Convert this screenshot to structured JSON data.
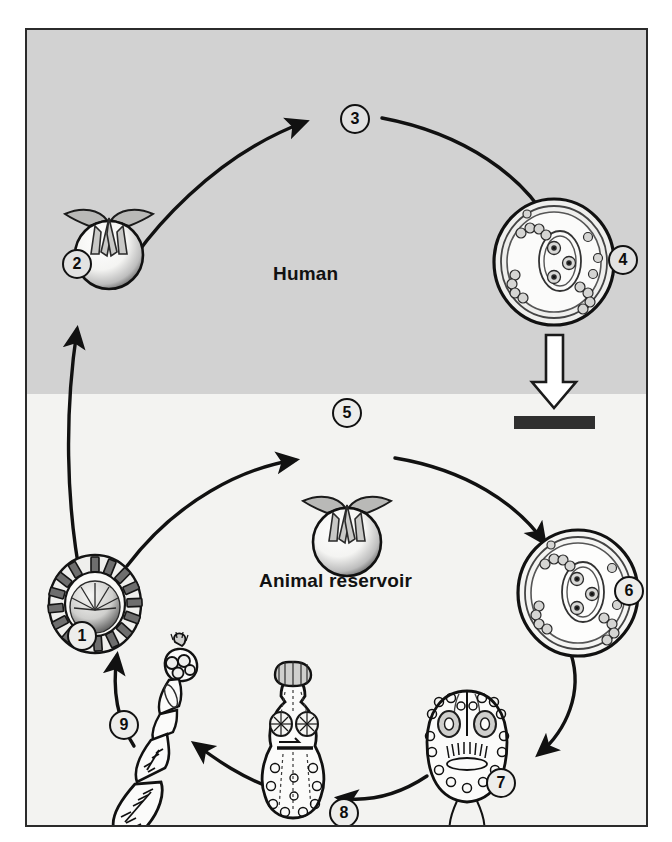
{
  "figure": {
    "type": "parasite-life-cycle-diagram",
    "zones": [
      {
        "id": "human",
        "label": "Human",
        "background": "#d2d2d2"
      },
      {
        "id": "animal",
        "label": "Animal reservoir",
        "background": "#f3f3f1"
      }
    ],
    "frame": {
      "border_color": "#2b2b2b"
    },
    "dead_end_bar": {
      "color": "#2b2b2b",
      "meaning": "dead-end-host-bar"
    },
    "stages": [
      {
        "number": "1",
        "name": "taeniid-egg",
        "zone": "animal",
        "x": 40,
        "y": 591
      },
      {
        "number": "2",
        "name": "oncosphere-hexacanth-human",
        "zone": "human",
        "x": 35,
        "y": 219
      },
      {
        "number": "3",
        "name": "migration-arrow-label",
        "zone": "human",
        "x": 313,
        "y": 74
      },
      {
        "number": "4",
        "name": "hydatid-cyst-human",
        "zone": "human",
        "x": 611,
        "y": 215
      },
      {
        "number": "5",
        "name": "oncosphere-hexacanth-animal",
        "zone": "animal",
        "x": 320,
        "y": 396
      },
      {
        "number": "6",
        "name": "hydatid-cyst-animal",
        "zone": "animal",
        "x": 617,
        "y": 546
      },
      {
        "number": "7",
        "name": "protoscolex",
        "zone": "animal",
        "x": 489,
        "y": 738
      },
      {
        "number": "8",
        "name": "developing-juvenile-worm",
        "zone": "animal",
        "x": 317,
        "y": 768
      },
      {
        "number": "9",
        "name": "adult-tapeworm",
        "zone": "animal",
        "x": 97,
        "y": 704
      }
    ]
  }
}
